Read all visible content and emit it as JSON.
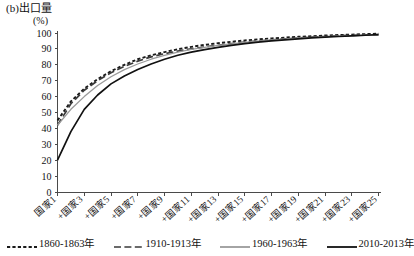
{
  "panel": {
    "title": "(b)出口量",
    "unit": "(%)"
  },
  "legend": {
    "position": "below-axes",
    "entries": [
      {
        "label": "1860-1863年",
        "style": "dotted",
        "color": "#1a1a1a"
      },
      {
        "label": "1910-1913年",
        "style": "dashed",
        "color": "#3a3a3a"
      },
      {
        "label": "1960-1963年",
        "style": "solid",
        "color": "#9a9a9a"
      },
      {
        "label": "2010-2013年",
        "style": "solid",
        "color": "#111111"
      }
    ]
  },
  "chart_data": {
    "type": "line",
    "title": "(b)出口量",
    "xlabel": "",
    "ylabel": "(%)",
    "ylim": [
      0,
      100
    ],
    "yticks": [
      0,
      10,
      20,
      30,
      40,
      50,
      60,
      70,
      80,
      90,
      100
    ],
    "grid": false,
    "x_tick_labels": [
      "国家1",
      "+国家3",
      "+国家5",
      "+国家7",
      "+国家9",
      "+国家11",
      "+国家13",
      "+国家15",
      "+国家17",
      "+国家19",
      "+国家21",
      "+国家23",
      "+国家25"
    ],
    "x": [
      1,
      2,
      3,
      4,
      5,
      6,
      7,
      8,
      9,
      10,
      11,
      12,
      13,
      14,
      15,
      16,
      17,
      18,
      19,
      20,
      21,
      22,
      23,
      24,
      25
    ],
    "series": [
      {
        "name": "1860-1863年",
        "style": "dotted",
        "color": "#1a1a1a",
        "values": [
          45,
          57,
          65,
          71,
          76,
          80,
          83.5,
          86,
          88,
          89.8,
          91.3,
          92.5,
          93.6,
          94.5,
          95.3,
          96,
          96.6,
          97.1,
          97.6,
          98,
          98.4,
          98.7,
          99,
          99.3,
          99.6
        ]
      },
      {
        "name": "1910-1913年",
        "style": "dashed",
        "color": "#3a3a3a",
        "values": [
          42,
          55.5,
          64,
          70,
          75,
          79,
          82.3,
          85,
          87,
          88.6,
          90,
          91.2,
          92.3,
          93.3,
          94.2,
          95,
          95.7,
          96.3,
          96.9,
          97.4,
          97.8,
          98.2,
          98.5,
          98.8,
          99
        ]
      },
      {
        "name": "1960-1963年",
        "style": "solid",
        "color": "#9a9a9a",
        "values": [
          42,
          52,
          60,
          67,
          72.5,
          77,
          80.5,
          83.5,
          86,
          88,
          89.7,
          91,
          92.2,
          93.2,
          94.1,
          94.9,
          95.6,
          96.2,
          96.8,
          97.3,
          97.7,
          98,
          98.3,
          98.6,
          98.8
        ]
      },
      {
        "name": "2010-2013年",
        "style": "solid",
        "color": "#111111",
        "values": [
          20,
          38,
          52,
          61,
          68,
          73,
          77,
          80.5,
          83.5,
          86,
          88,
          89.6,
          91,
          92.2,
          93.3,
          94.2,
          95,
          95.7,
          96.3,
          96.9,
          97.4,
          97.8,
          98.2,
          98.6,
          99
        ]
      }
    ]
  }
}
